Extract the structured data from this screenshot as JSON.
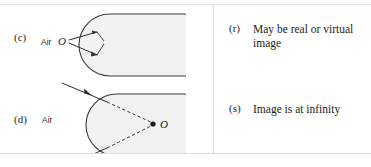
{
  "figure": {
    "type": "optics-matching-diagram",
    "colors": {
      "glass_fill": "#f1f1f1",
      "outline": "#3c3c3c",
      "ray": "#2d2d2d",
      "text": "#1d1d1d",
      "rule": "#dddddd",
      "background": "#ffffff"
    },
    "left_column": {
      "items": [
        {
          "label": "(c)",
          "medium_label": "Air",
          "object_label": "O",
          "object_marker": "hollow",
          "description": "Diverging rays from object O in air strike a convex glass surface; glass body shaded, rounded on the left"
        },
        {
          "label": "(d)",
          "medium_label": "Air",
          "object_label": "O",
          "object_marker": "filled-dot",
          "description": "Converging rays in air enter a convex glass surface; dashed extensions meet at point O inside the glass"
        }
      ]
    },
    "right_column": {
      "items": [
        {
          "marker": "(r)",
          "text": "May be real or virtual image"
        },
        {
          "marker": "(s)",
          "text": "Image is at infinity"
        }
      ]
    }
  }
}
